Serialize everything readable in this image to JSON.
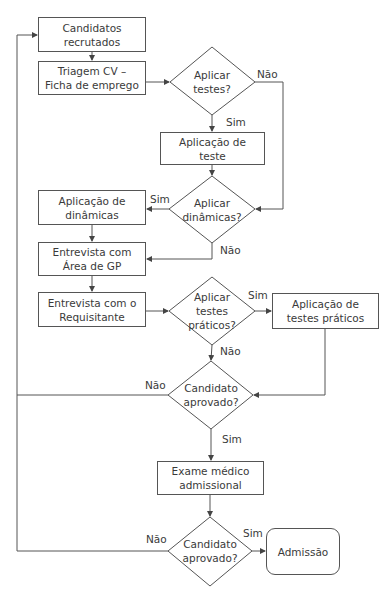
{
  "diagram": {
    "type": "flowchart",
    "language": "pt",
    "nodes": {
      "candidatos": {
        "label": "Candidatos\nrecrutados",
        "shape": "rect"
      },
      "triagem": {
        "label": "Triagem CV –\nFicha de emprego",
        "shape": "rect"
      },
      "aplicar_testes": {
        "label": "Aplicar\ntestes?",
        "shape": "diamond"
      },
      "aplicacao_teste": {
        "label": "Aplicação de\nteste",
        "shape": "rect"
      },
      "aplicar_dinamicas": {
        "label": "Aplicar\ndinâmicas?",
        "shape": "diamond"
      },
      "aplicacao_dinamicas": {
        "label": "Aplicação de\ndinâmicas",
        "shape": "rect"
      },
      "entrevista_gp": {
        "label": "Entrevista com\nÁrea de GP",
        "shape": "rect"
      },
      "entrevista_req": {
        "label": "Entrevista com o\nRequisitante",
        "shape": "rect"
      },
      "aplicar_praticos": {
        "label": "Aplicar\ntestes\npráticos?",
        "shape": "diamond"
      },
      "aplicacao_praticos": {
        "label": "Aplicação de\ntestes práticos",
        "shape": "rect"
      },
      "aprovado1": {
        "label": "Candidato\naprovado?",
        "shape": "diamond"
      },
      "exame": {
        "label": "Exame médico\nadmissional",
        "shape": "rect"
      },
      "aprovado2": {
        "label": "Candidato\naprovado?",
        "shape": "diamond"
      },
      "admissao": {
        "label": "Admissão",
        "shape": "rounded"
      }
    },
    "edge_labels": {
      "testes_nao": "Não",
      "testes_sim": "Sim",
      "dinamicas_sim": "Sim",
      "dinamicas_nao": "Não",
      "praticos_sim": "Sim",
      "praticos_nao": "Não",
      "aprovado1_nao": "Não",
      "aprovado1_sim": "Sim",
      "aprovado2_nao": "Não",
      "aprovado2_sim": "Sim"
    },
    "edges": [
      {
        "from": "candidatos",
        "to": "triagem"
      },
      {
        "from": "triagem",
        "to": "aplicar_testes"
      },
      {
        "from": "aplicar_testes",
        "to": "aplicacao_teste",
        "label": "Sim"
      },
      {
        "from": "aplicar_testes",
        "to": "aplicar_dinamicas",
        "label": "Não"
      },
      {
        "from": "aplicacao_teste",
        "to": "aplicar_dinamicas"
      },
      {
        "from": "aplicar_dinamicas",
        "to": "aplicacao_dinamicas",
        "label": "Sim"
      },
      {
        "from": "aplicar_dinamicas",
        "to": "entrevista_gp",
        "label": "Não"
      },
      {
        "from": "aplicacao_dinamicas",
        "to": "entrevista_gp"
      },
      {
        "from": "entrevista_gp",
        "to": "entrevista_req"
      },
      {
        "from": "entrevista_req",
        "to": "aplicar_praticos"
      },
      {
        "from": "aplicar_praticos",
        "to": "aplicacao_praticos",
        "label": "Sim"
      },
      {
        "from": "aplicar_praticos",
        "to": "aprovado1",
        "label": "Não"
      },
      {
        "from": "aplicacao_praticos",
        "to": "aprovado1"
      },
      {
        "from": "aprovado1",
        "to": "candidatos",
        "label": "Não"
      },
      {
        "from": "aprovado1",
        "to": "exame",
        "label": "Sim"
      },
      {
        "from": "exame",
        "to": "aprovado2"
      },
      {
        "from": "aprovado2",
        "to": "candidatos",
        "label": "Não"
      },
      {
        "from": "aprovado2",
        "to": "admissao",
        "label": "Sim"
      }
    ]
  },
  "colors": {
    "stroke": "#555555",
    "text": "#3a3a3a",
    "background": "#ffffff"
  }
}
